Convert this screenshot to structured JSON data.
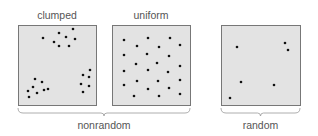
{
  "panels": [
    {
      "id": "clumped",
      "label": "clumped",
      "box": {
        "x": 18,
        "y": 25,
        "w": 78,
        "h": 80
      },
      "dots": [
        [
          43,
          38
        ],
        [
          59,
          33
        ],
        [
          66,
          37
        ],
        [
          73,
          29
        ],
        [
          75,
          39
        ],
        [
          59,
          46
        ],
        [
          69,
          46
        ],
        [
          54,
          42
        ],
        [
          35,
          79
        ],
        [
          42,
          82
        ],
        [
          33,
          87
        ],
        [
          28,
          91
        ],
        [
          37,
          93
        ],
        [
          44,
          90
        ],
        [
          48,
          89
        ],
        [
          29,
          97
        ],
        [
          83,
          75
        ],
        [
          90,
          70
        ],
        [
          89,
          77
        ],
        [
          81,
          84
        ],
        [
          89,
          86
        ],
        [
          83,
          92
        ]
      ]
    },
    {
      "id": "uniform",
      "label": "uniform",
      "box": {
        "x": 112,
        "y": 25,
        "w": 78,
        "h": 80
      },
      "dots": [
        [
          124,
          40
        ],
        [
          148,
          38
        ],
        [
          170,
          38
        ],
        [
          137,
          46
        ],
        [
          159,
          47
        ],
        [
          180,
          45
        ],
        [
          124,
          55
        ],
        [
          147,
          54
        ],
        [
          169,
          56
        ],
        [
          136,
          64
        ],
        [
          157,
          63
        ],
        [
          180,
          66
        ],
        [
          124,
          71
        ],
        [
          148,
          70
        ],
        [
          168,
          72
        ],
        [
          137,
          81
        ],
        [
          158,
          81
        ],
        [
          180,
          80
        ],
        [
          124,
          85
        ],
        [
          148,
          89
        ],
        [
          169,
          88
        ],
        [
          134,
          96
        ],
        [
          159,
          96
        ],
        [
          180,
          94
        ]
      ]
    },
    {
      "id": "random",
      "label": "random",
      "box": {
        "x": 221,
        "y": 25,
        "w": 79,
        "h": 80
      },
      "dots": [
        [
          237,
          47
        ],
        [
          285,
          43
        ],
        [
          288,
          50
        ],
        [
          241,
          82
        ],
        [
          274,
          85
        ],
        [
          230,
          98
        ]
      ]
    }
  ],
  "groups": [
    {
      "id": "nonrandom",
      "label": "nonrandom",
      "x1": 18,
      "x2": 190
    },
    {
      "id": "random-group",
      "label": "random",
      "x1": 221,
      "x2": 300
    }
  ],
  "colors": {
    "box_fill": "#e3e3e3",
    "box_stroke": "#777777",
    "dot": "#111111",
    "text": "#555555",
    "bracket": "#999999"
  }
}
